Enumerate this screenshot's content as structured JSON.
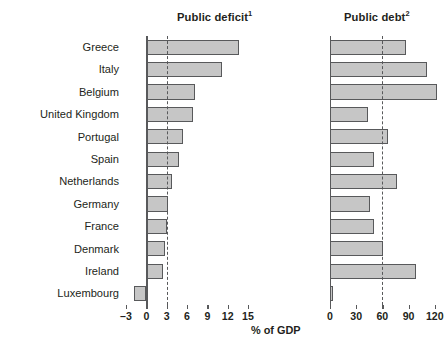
{
  "figure": {
    "axis_caption": "% of GDP",
    "footnote_sliver": "",
    "bar_fill_color": "#c6c6c6",
    "bar_border_color": "#58595b",
    "axis_color": "#58595b",
    "text_color": "#231f20"
  },
  "categories": [
    "Greece",
    "Italy",
    "Belgium",
    "United Kingdom",
    "Portugal",
    "Spain",
    "Netherlands",
    "Germany",
    "France",
    "Denmark",
    "Ireland",
    "Luxembourg"
  ],
  "panels": [
    {
      "title": "Public deficit",
      "title_superscript": "1",
      "ticks": [
        "-3",
        "0",
        "3",
        "6",
        "9",
        "12",
        "15"
      ],
      "tick_values": [
        -3,
        0,
        3,
        6,
        9,
        12,
        15
      ],
      "xlim": [
        -3,
        15
      ],
      "reference_line": 3
    },
    {
      "title": "Public debt",
      "title_superscript": "2",
      "ticks": [
        "0",
        "30",
        "60",
        "90",
        "120"
      ],
      "tick_values": [
        0,
        30,
        60,
        90,
        120
      ],
      "xlim": [
        0,
        126
      ],
      "reference_line": 60
    }
  ],
  "chart_data": [
    {
      "type": "bar",
      "orientation": "horizontal",
      "title": "Public deficit",
      "title_superscript": "1",
      "xlabel": "% of GDP",
      "ylabel": "",
      "xlim": [
        -3,
        15
      ],
      "xticks": [
        -3,
        0,
        3,
        6,
        9,
        12,
        15
      ],
      "grid": false,
      "reference_line": {
        "value": 3,
        "style": "dashed",
        "label": ""
      },
      "categories": [
        "Greece",
        "Italy",
        "Belgium",
        "United Kingdom",
        "Portugal",
        "Spain",
        "Netherlands",
        "Germany",
        "France",
        "Denmark",
        "Ireland",
        "Luxembourg"
      ],
      "values": [
        13.6,
        11.2,
        7.2,
        6.9,
        5.4,
        4.8,
        3.8,
        3.2,
        3.0,
        2.7,
        2.4,
        -1.8
      ]
    },
    {
      "type": "bar",
      "orientation": "horizontal",
      "title": "Public debt",
      "title_superscript": "2",
      "xlabel": "% of GDP",
      "ylabel": "",
      "xlim": [
        0,
        126
      ],
      "xticks": [
        0,
        30,
        60,
        90,
        120
      ],
      "grid": false,
      "reference_line": {
        "value": 60,
        "style": "dashed",
        "label": ""
      },
      "categories": [
        "Greece",
        "Italy",
        "Belgium",
        "United Kingdom",
        "Portugal",
        "Spain",
        "Netherlands",
        "Germany",
        "France",
        "Denmark",
        "Ireland",
        "Luxembourg"
      ],
      "values": [
        87,
        111,
        122,
        44,
        66,
        50,
        77,
        46,
        50,
        61,
        98,
        4
      ]
    }
  ]
}
